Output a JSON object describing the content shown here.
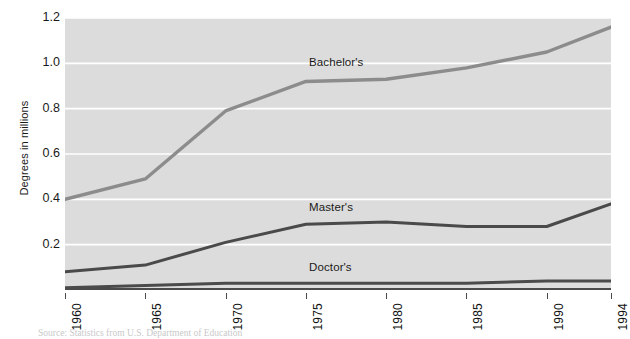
{
  "chart_data": {
    "type": "line",
    "title": "",
    "subtitle": "",
    "xlabel": "",
    "ylabel": "Degrees in millions",
    "xlim": [
      1960,
      1994
    ],
    "ylim": [
      0,
      1.2
    ],
    "grid": "horizontal-white",
    "legend_position": "inline-labels",
    "x_tick_labels": [
      "1960",
      "1965",
      "1970",
      "1975",
      "1980",
      "1985",
      "1990",
      "1994"
    ],
    "x_tick_values": [
      1960,
      1965,
      1970,
      1975,
      1980,
      1985,
      1990,
      1994
    ],
    "y_tick_labels": [
      "0.2",
      "0.4",
      "0.6",
      "0.8",
      "1.0",
      "1.2"
    ],
    "y_tick_values": [
      0.2,
      0.4,
      0.6,
      0.8,
      1.0,
      1.2
    ],
    "x": [
      1960,
      1965,
      1970,
      1975,
      1980,
      1985,
      1990,
      1994
    ],
    "series": [
      {
        "name": "Bachelor's",
        "color": "#8c8c8c",
        "values": [
          0.4,
          0.49,
          0.79,
          0.92,
          0.93,
          0.98,
          1.05,
          1.16
        ],
        "label_x": 1975.2,
        "label_y": 1.0
      },
      {
        "name": "Master's",
        "color": "#4a4a4a",
        "values": [
          0.08,
          0.11,
          0.21,
          0.29,
          0.3,
          0.28,
          0.28,
          0.38
        ],
        "label_x": 1975.2,
        "label_y": 0.36
      },
      {
        "name": "Doctor's",
        "color": "#4a4a4a",
        "values": [
          0.01,
          0.02,
          0.03,
          0.03,
          0.03,
          0.03,
          0.04,
          0.04
        ],
        "label_x": 1975.2,
        "label_y": 0.095
      }
    ],
    "annotations": []
  },
  "source_note": "Source: Statistics from U.S. Department of Education",
  "axis_title": {
    "y": "Degrees in millions"
  }
}
